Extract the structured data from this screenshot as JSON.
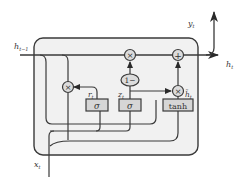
{
  "diagram": {
    "type": "GRU cell",
    "colors": {
      "line": "#3a3a3a",
      "cell_fill": "#f1f1f1",
      "gate_fill": "#d6d6d6",
      "op_fill": "#dcdcdc"
    },
    "inputs": {
      "h_prev": {
        "base": "h",
        "sub": "t−1"
      },
      "x": {
        "base": "x",
        "sub": "t"
      }
    },
    "outputs": {
      "h": {
        "base": "h",
        "sub": "t"
      },
      "y": {
        "base": "y",
        "sub": "t"
      }
    },
    "gates": [
      {
        "id": "reset",
        "label": "σ",
        "output": {
          "base": "r",
          "sub": "t"
        }
      },
      {
        "id": "update",
        "label": "σ",
        "output": {
          "base": "z",
          "sub": "t"
        }
      },
      {
        "id": "candidate",
        "label": "tanh",
        "output": {
          "base": "h̃",
          "sub": "t"
        }
      }
    ],
    "operations": [
      {
        "id": "mul-reset",
        "symbol": "×"
      },
      {
        "id": "mul-top",
        "symbol": "×"
      },
      {
        "id": "add-top",
        "symbol": "+"
      },
      {
        "id": "one-minus",
        "symbol": "1−"
      },
      {
        "id": "mul-candidate",
        "symbol": "×"
      }
    ]
  }
}
